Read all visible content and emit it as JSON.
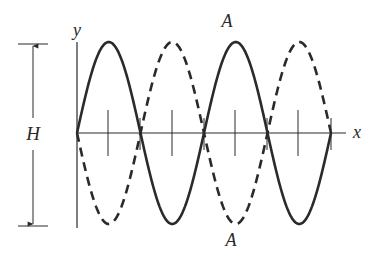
{
  "diagram": {
    "type": "standing-wave",
    "labels": {
      "y_axis": "y",
      "x_axis": "x",
      "height": "H",
      "antinode_top": "A",
      "antinode_bottom": "A"
    },
    "colors": {
      "stroke": "#2a2a2a",
      "background": "#ffffff"
    },
    "geometry": {
      "origin_x": 77,
      "axis_y": 133,
      "x_end": 345,
      "y_top": 42,
      "y_bottom": 228,
      "amplitude_px": 91,
      "half_wavelength_px": 63.5,
      "loops": 4,
      "nodes_x": [
        77,
        140,
        204,
        267,
        331
      ],
      "ticks_x": [
        108,
        172,
        235,
        298
      ],
      "tick_top": 110,
      "tick_bottom": 156,
      "dimension_x": 33,
      "dimension_top": 44,
      "dimension_bottom": 226
    },
    "curves": [
      {
        "name": "solid-wave",
        "style": "solid",
        "phase": 1
      },
      {
        "name": "dashed-wave",
        "style": "dashed",
        "phase": -1
      }
    ]
  }
}
